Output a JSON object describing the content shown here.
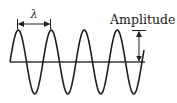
{
  "diagram": {
    "labels": {
      "wavelength": "λ",
      "amplitude": "Amplitude"
    },
    "wave": {
      "cycles": 4,
      "wavelength_px": 33,
      "amplitude_px": 32,
      "baseline_y": 62,
      "start_x": 10,
      "end_x": 144
    },
    "colors": {
      "stroke": "#1e1e1e",
      "axis": "#3a3a3a",
      "background": "#ffffff"
    }
  }
}
